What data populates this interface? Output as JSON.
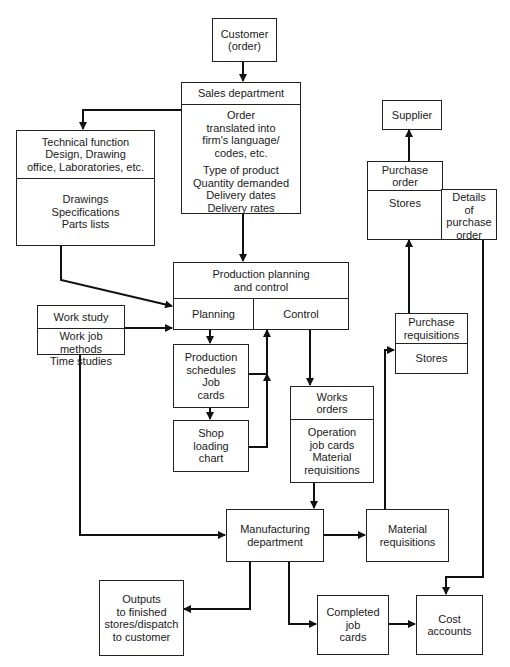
{
  "diagram": {
    "type": "flowchart",
    "nodes": {
      "customer": {
        "lines": [
          "Customer",
          "(order)"
        ]
      },
      "sales": {
        "title": "Sales department",
        "body1": [
          "Order",
          "translated into",
          "firm's language/",
          "codes, etc."
        ],
        "body2": [
          "Type of product",
          "Quantity demanded",
          "Delivery dates",
          "Delivery rates"
        ]
      },
      "technical": {
        "title": [
          "Technical function",
          "Design, Drawing",
          "office, Laboratories, etc."
        ],
        "body": [
          "Drawings",
          "Specifications",
          "Parts lists"
        ]
      },
      "supplier": {
        "lines": [
          "Supplier"
        ]
      },
      "purchase_order": {
        "title": [
          "Purchase",
          "order"
        ],
        "stores": "Stores",
        "details": [
          "Details",
          "of",
          "purchase",
          "order"
        ]
      },
      "ppc": {
        "title": [
          "Production planning",
          "and control"
        ],
        "planning": "Planning",
        "control": "Control"
      },
      "work_study": {
        "title": "Work study",
        "body": [
          "Work job",
          "methods",
          "Time studies"
        ]
      },
      "production_schedules": {
        "lines": [
          "Production",
          "schedules",
          "Job",
          "cards"
        ]
      },
      "shop_loading": {
        "lines": [
          "Shop",
          "loading",
          "chart"
        ]
      },
      "works_orders": {
        "title": [
          "Works",
          "orders"
        ],
        "body": [
          "Operation",
          "job cards",
          "Material",
          "requisitions"
        ]
      },
      "purchase_requisitions": {
        "title": [
          "Purchase",
          "requisitions"
        ],
        "body": "Stores"
      },
      "manufacturing": {
        "lines": [
          "Manufacturing",
          "department"
        ]
      },
      "material_requisitions": {
        "lines": [
          "Material",
          "requisitions"
        ]
      },
      "outputs": {
        "lines": [
          "Outputs",
          "to finished",
          "stores/dispatch",
          "to customer"
        ]
      },
      "completed_job_cards": {
        "lines": [
          "Completed",
          "job",
          "cards"
        ]
      },
      "cost_accounts": {
        "lines": [
          "Cost",
          "accounts"
        ]
      }
    },
    "edges": [
      {
        "from": "Customer (order)",
        "to": "Sales department"
      },
      {
        "from": "Sales department",
        "to": "Technical function"
      },
      {
        "from": "Sales department",
        "to": "Production planning and control"
      },
      {
        "from": "Technical function",
        "to": "Planning"
      },
      {
        "from": "Work study",
        "to": "Planning"
      },
      {
        "from": "Work study",
        "to": "Manufacturing department"
      },
      {
        "from": "Planning",
        "to": "Production schedules / Job cards"
      },
      {
        "from": "Production schedules / Job cards",
        "to": "Shop loading chart"
      },
      {
        "from": "Production schedules / Job cards",
        "to": "Control"
      },
      {
        "from": "Shop loading chart",
        "to": "Control"
      },
      {
        "from": "Control",
        "to": "Works orders"
      },
      {
        "from": "Works orders",
        "to": "Manufacturing department"
      },
      {
        "from": "Manufacturing department",
        "to": "Material requisitions"
      },
      {
        "from": "Material requisitions",
        "to": "Purchase requisitions"
      },
      {
        "from": "Purchase requisitions",
        "to": "Purchase order / Stores"
      },
      {
        "from": "Purchase order",
        "to": "Supplier"
      },
      {
        "from": "Details of purchase order",
        "to": "Cost accounts"
      },
      {
        "from": "Manufacturing department",
        "to": "Outputs to finished stores/dispatch to customer"
      },
      {
        "from": "Manufacturing department",
        "to": "Completed job cards"
      },
      {
        "from": "Completed job cards",
        "to": "Cost accounts"
      }
    ],
    "colors": {
      "stroke": "#222222",
      "background": "#ffffff"
    }
  }
}
